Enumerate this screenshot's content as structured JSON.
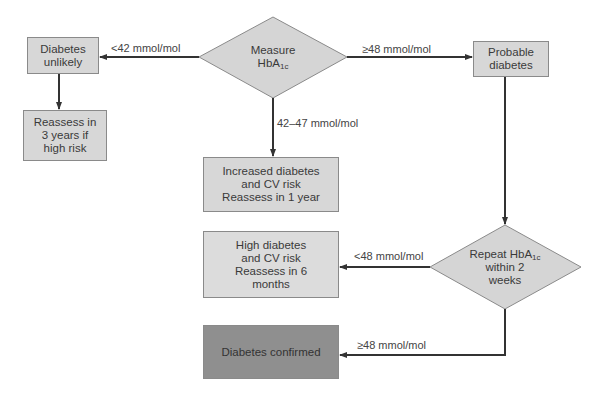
{
  "nodes": {
    "measure": {
      "line1": "Measure",
      "base": "HbA",
      "sub": "1c"
    },
    "unlikely": {
      "line1": "Diabetes",
      "line2": "unlikely"
    },
    "reassess3": {
      "line1": "Reassess in",
      "line2": "3 years if",
      "line3": "high risk"
    },
    "probable": {
      "line1": "Probable",
      "line2": "diabetes"
    },
    "increased": {
      "line1": "Increased diabetes",
      "line2": "and CV risk",
      "line3": "Reassess in 1 year"
    },
    "repeat": {
      "base": "Repeat HbA",
      "sub": "1c",
      "line2": "within 2",
      "line3": "weeks"
    },
    "high": {
      "line1": "High diabetes",
      "line2": "and CV risk",
      "line3": "Reassess in 6",
      "line4": "months"
    },
    "confirmed": {
      "line1": "Diabetes confirmed"
    }
  },
  "edges": {
    "lt42": "<42 mmol/mol",
    "ge48_top": "≥48 mmol/mol",
    "mid": "42–47 mmol/mol",
    "lt48": "<48 mmol/mol",
    "ge48_bottom": "≥48 mmol/mol"
  },
  "colors": {
    "box": "#d7d7d7",
    "confirmed": "#8f8f8f",
    "line": "#333333"
  }
}
